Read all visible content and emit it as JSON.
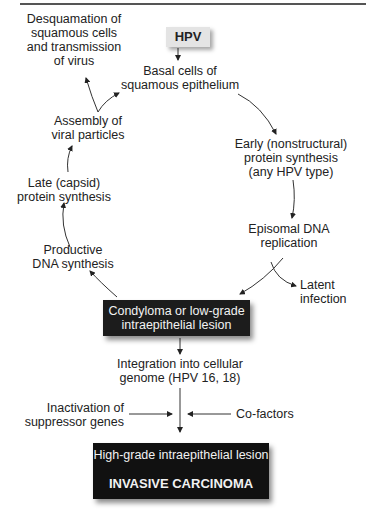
{
  "diagram": {
    "type": "flowchart",
    "nodes": {
      "hpv": "HPV",
      "basal_cells": [
        "Basal cells of",
        "squamous epithelium"
      ],
      "early_protein": [
        "Early (nonstructural)",
        "protein synthesis",
        "(any HPV type)"
      ],
      "episomal_dna": [
        "Episomal DNA",
        "replication"
      ],
      "latent_infection": [
        "Latent",
        "infection"
      ],
      "condyloma": [
        "Condyloma or low-grade",
        "intraepithelial lesion"
      ],
      "productive_dna": [
        "Productive",
        "DNA synthesis"
      ],
      "late_protein": [
        "Late (capsid)",
        "protein synthesis"
      ],
      "assembly": [
        "Assembly of",
        "viral particles"
      ],
      "desquamation": [
        "Desquamation of",
        "squamous cells",
        "and transmission",
        "of virus"
      ],
      "integration": [
        "Integration into cellular",
        "genome (HPV 16, 18)"
      ],
      "inactivation": [
        "Inactivation of",
        "suppressor genes"
      ],
      "cofactors": "Co-factors",
      "high_grade": "High-grade intraepithelial lesion",
      "invasive": "INVASIVE CARCINOMA"
    },
    "edges": [
      [
        "hpv",
        "basal_cells"
      ],
      [
        "basal_cells",
        "early_protein"
      ],
      [
        "early_protein",
        "episomal_dna"
      ],
      [
        "episomal_dna",
        "condyloma"
      ],
      [
        "episomal_dna",
        "latent_infection"
      ],
      [
        "condyloma",
        "productive_dna"
      ],
      [
        "productive_dna",
        "late_protein"
      ],
      [
        "late_protein",
        "assembly"
      ],
      [
        "assembly",
        "basal_cells"
      ],
      [
        "assembly",
        "desquamation"
      ],
      [
        "condyloma",
        "integration"
      ],
      [
        "integration",
        "high_grade"
      ],
      [
        "inactivation",
        "high_grade"
      ],
      [
        "cofactors",
        "high_grade"
      ],
      [
        "high_grade",
        "invasive"
      ]
    ],
    "colors": {
      "dark_box": "#111111",
      "hpv_box": "#e4e4e4",
      "text": "#222222"
    }
  }
}
